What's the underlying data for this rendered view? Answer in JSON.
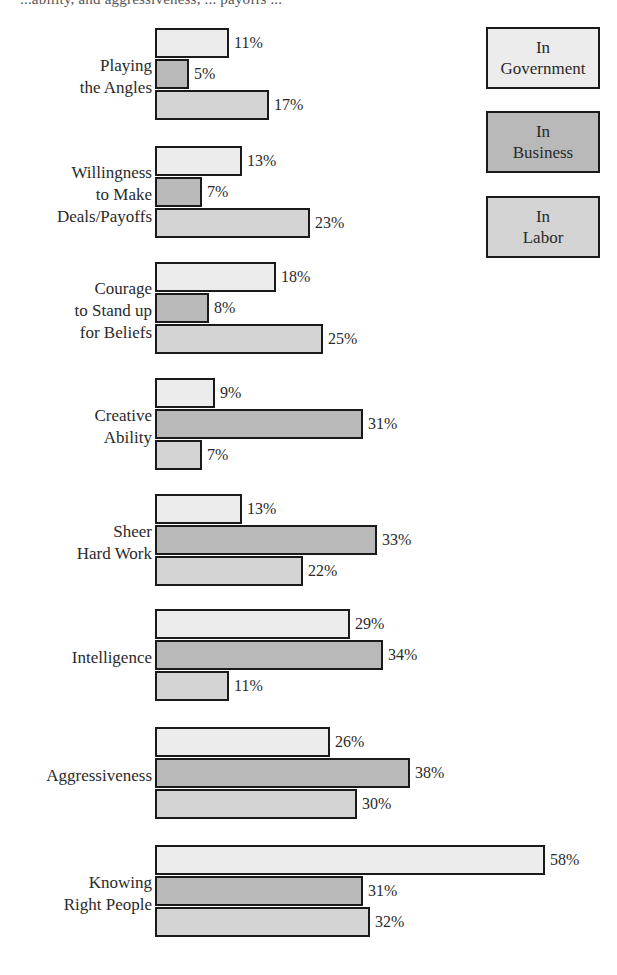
{
  "header": {
    "cut_off_text": "...ability, and aggressiveness, ... payoffs ..."
  },
  "legend": [
    {
      "key": "gov",
      "line1": "In",
      "line2": "Government",
      "color": "#ececec"
    },
    {
      "key": "bus",
      "line1": "In",
      "line2": "Business",
      "color": "#b9b9b9"
    },
    {
      "key": "lab",
      "line1": "In",
      "line2": "Labor",
      "color": "#d4d4d4"
    }
  ],
  "groups": [
    {
      "label": "Playing\nthe Angles",
      "gov": "11%",
      "bus": "5%",
      "lab": "17%"
    },
    {
      "label": "Willingness\nto Make\nDeals/Payoffs",
      "gov": "13%",
      "bus": "7%",
      "lab": "23%"
    },
    {
      "label": "Courage\nto Stand up\nfor Beliefs",
      "gov": "18%",
      "bus": "8%",
      "lab": "25%"
    },
    {
      "label": "Creative\nAbility",
      "gov": "9%",
      "bus": "31%",
      "lab": "7%"
    },
    {
      "label": "Sheer\nHard Work",
      "gov": "13%",
      "bus": "33%",
      "lab": "22%"
    },
    {
      "label": "Intelligence",
      "gov": "29%",
      "bus": "34%",
      "lab": "11%"
    },
    {
      "label": "Aggressiveness",
      "gov": "26%",
      "bus": "38%",
      "lab": "30%"
    },
    {
      "label": "Knowing\nRight People",
      "gov": "58%",
      "bus": "31%",
      "lab": "32%"
    }
  ],
  "chart_data": {
    "type": "bar",
    "orientation": "horizontal",
    "title": "",
    "xlabel": "",
    "ylabel": "",
    "categories": [
      "Playing the Angles",
      "Willingness to Make Deals/Payoffs",
      "Courage to Stand up for Beliefs",
      "Creative Ability",
      "Sheer Hard Work",
      "Intelligence",
      "Aggressiveness",
      "Knowing Right People"
    ],
    "series": [
      {
        "name": "In Government",
        "values": [
          11,
          13,
          18,
          9,
          13,
          29,
          26,
          58
        ]
      },
      {
        "name": "In Business",
        "values": [
          5,
          7,
          8,
          31,
          33,
          34,
          38,
          31
        ]
      },
      {
        "name": "In Labor",
        "values": [
          17,
          23,
          25,
          7,
          22,
          11,
          30,
          32
        ]
      }
    ],
    "value_suffix": "%",
    "xlim": [
      0,
      60
    ],
    "grid": false,
    "axes_visible": false,
    "legend_position": "top-right",
    "data_labels": true
  }
}
